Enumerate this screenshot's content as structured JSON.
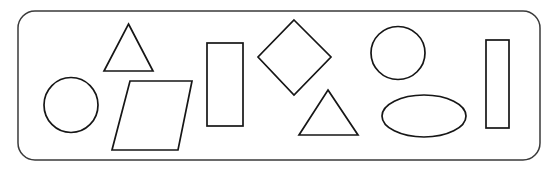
{
  "scene": {
    "title": "Geometric shapes worksheet panel",
    "canvas": {
      "width": 554,
      "height": 171,
      "background": "#ffffff"
    },
    "frame": {
      "name": "rounded-rectangle-panel",
      "x": 18,
      "y": 11,
      "width": 522,
      "height": 149,
      "corner_radius": 17,
      "stroke": "#3a3a3a",
      "stroke_width": 1.5,
      "fill": "#ffffff"
    },
    "stroke_color": "#161616",
    "stroke_width": 1.7,
    "fill_color": "none",
    "shape_count": 9,
    "shapes": [
      {
        "id": 1,
        "name": "circle-small-left",
        "type": "circle",
        "label": "Circle",
        "cx": 71,
        "cy": 105,
        "rx": 27,
        "ry": 27.5
      },
      {
        "id": 2,
        "name": "triangle-upper-left",
        "type": "triangle",
        "label": "Triangle",
        "points": "128.5,24 153,71 104,71"
      },
      {
        "id": 3,
        "name": "parallelogram-left",
        "type": "parallelogram",
        "label": "Parallelogram",
        "points": "130,81 192,81 178,150 112,150"
      },
      {
        "id": 4,
        "name": "rectangle-center",
        "type": "rectangle",
        "label": "Rectangle",
        "x": 207,
        "y": 43,
        "width": 36,
        "height": 83
      },
      {
        "id": 5,
        "name": "diamond-center",
        "type": "diamond",
        "label": "Diamond",
        "points": "294,20 331,57 294,95 258,57"
      },
      {
        "id": 6,
        "name": "triangle-center-lower",
        "type": "triangle",
        "label": "Triangle",
        "points": "328,90 358,135 299,135"
      },
      {
        "id": 7,
        "name": "circle-upper-right",
        "type": "circle",
        "label": "Circle",
        "cx": 398,
        "cy": 53,
        "rx": 27,
        "ry": 26.5
      },
      {
        "id": 8,
        "name": "ellipse-lower-right",
        "type": "ellipse",
        "label": "Ellipse",
        "cx": 424,
        "cy": 116,
        "rx": 42,
        "ry": 21
      },
      {
        "id": 9,
        "name": "rectangle-right",
        "type": "rectangle",
        "label": "Rectangle",
        "x": 486,
        "y": 40,
        "width": 23,
        "height": 88
      }
    ]
  }
}
